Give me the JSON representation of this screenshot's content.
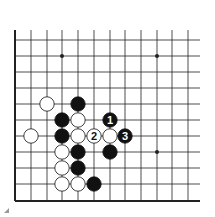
{
  "diagram": {
    "type": "go-board-fragment",
    "grid": {
      "x_lines": [
        15,
        31,
        47,
        62,
        78,
        94,
        110,
        125,
        141,
        157,
        172,
        188
      ],
      "y_lines": [
        40,
        56,
        72,
        88,
        104,
        120,
        136,
        152,
        168,
        184,
        201
      ],
      "top_open_y": 30,
      "right_open_x": 200,
      "left_edge": true,
      "bottom_edge": true
    },
    "hoshi": [
      [
        3,
        1
      ],
      [
        9,
        1
      ],
      [
        9,
        7
      ]
    ],
    "stones": [
      {
        "col": 2,
        "row": 4,
        "color": "white",
        "label": ""
      },
      {
        "col": 4,
        "row": 4,
        "color": "black",
        "label": ""
      },
      {
        "col": 3,
        "row": 5,
        "color": "black",
        "label": ""
      },
      {
        "col": 4,
        "row": 5,
        "color": "white",
        "label": ""
      },
      {
        "col": 6,
        "row": 5,
        "color": "black",
        "label": "1"
      },
      {
        "col": 1,
        "row": 6,
        "color": "white",
        "label": ""
      },
      {
        "col": 3,
        "row": 6,
        "color": "black",
        "label": ""
      },
      {
        "col": 4,
        "row": 6,
        "color": "white",
        "label": ""
      },
      {
        "col": 5,
        "row": 6,
        "color": "white",
        "label": "2"
      },
      {
        "col": 6,
        "row": 6,
        "color": "white",
        "label": ""
      },
      {
        "col": 7,
        "row": 6,
        "color": "black",
        "label": "3"
      },
      {
        "col": 3,
        "row": 7,
        "color": "white",
        "label": ""
      },
      {
        "col": 4,
        "row": 7,
        "color": "black",
        "label": ""
      },
      {
        "col": 6,
        "row": 7,
        "color": "black",
        "label": ""
      },
      {
        "col": 3,
        "row": 8,
        "color": "white",
        "label": ""
      },
      {
        "col": 4,
        "row": 8,
        "color": "black",
        "label": ""
      },
      {
        "col": 3,
        "row": 9,
        "color": "white",
        "label": ""
      },
      {
        "col": 4,
        "row": 9,
        "color": "white",
        "label": ""
      },
      {
        "col": 5,
        "row": 9,
        "color": "black",
        "label": ""
      }
    ],
    "colors": {
      "line": "#222222",
      "black_stone": "#111111",
      "white_stone": "#ffffff",
      "background": "#ffffff"
    }
  }
}
